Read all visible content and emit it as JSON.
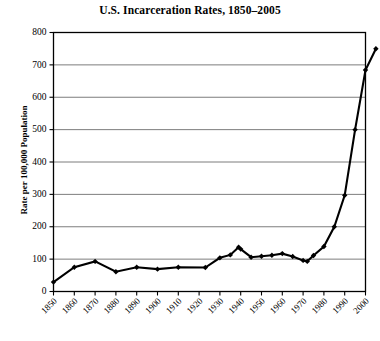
{
  "chart_data": {
    "type": "line",
    "title": "U.S. Incarceration Rates, 1850–2005",
    "xlabel": "",
    "ylabel": "Rate per 100,000 Population",
    "xlim": [
      1850,
      2005
    ],
    "ylim": [
      0,
      800
    ],
    "ytick_step": 100,
    "yticks": [
      0,
      100,
      200,
      300,
      400,
      500,
      600,
      700,
      800
    ],
    "ytick_labels": [
      "0",
      "100",
      "200",
      "300",
      "400",
      "500",
      "600",
      "700",
      "800"
    ],
    "xticks": [
      1850,
      1860,
      1870,
      1880,
      1890,
      1900,
      1910,
      1920,
      1930,
      1940,
      1950,
      1960,
      1970,
      1980,
      1990,
      2000
    ],
    "xtick_labels": [
      "1850",
      "1860",
      "1870",
      "1880",
      "1890",
      "1900",
      "1910",
      "1920",
      "1930",
      "1940",
      "1950",
      "1960",
      "1970",
      "1980",
      "1990",
      "2000"
    ],
    "xtick_rotation_deg": 45,
    "grid": "horizontal",
    "legend": "none",
    "marker": "diamond",
    "line_color": "#000000",
    "grid_color": "#6e6e6e",
    "axis_color": "#000000",
    "background_color": "#ffffff",
    "series": [
      {
        "name": "U.S. incarceration rate",
        "x": [
          1850,
          1860,
          1870,
          1880,
          1890,
          1900,
          1910,
          1923,
          1930,
          1935,
          1939,
          1940,
          1945,
          1950,
          1955,
          1960,
          1965,
          1970,
          1972,
          1975,
          1980,
          1985,
          1990,
          1995,
          2000,
          2005
        ],
        "values": [
          29,
          75,
          93,
          61,
          75,
          69,
          75,
          74,
          104,
          113,
          137,
          131,
          106,
          109,
          112,
          117,
          108,
          96,
          93,
          111,
          139,
          200,
          297,
          500,
          684,
          750
        ]
      }
    ]
  }
}
